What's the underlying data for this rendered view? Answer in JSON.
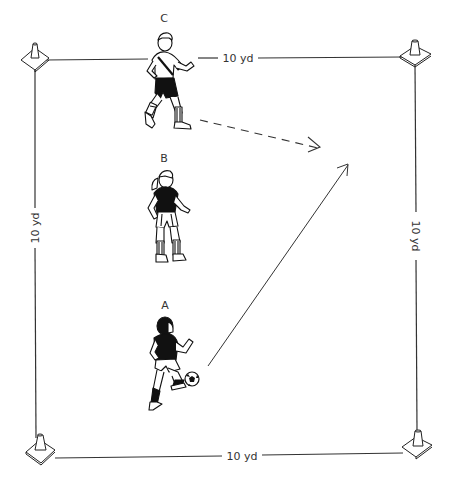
{
  "diagram": {
    "type": "soccer-drill",
    "field": {
      "shape": "square",
      "side_labels": {
        "top": "10 yd",
        "bottom": "10 yd",
        "left": "10 yd",
        "right": "10 yd"
      },
      "corners": [
        "cone",
        "cone",
        "cone",
        "cone"
      ]
    },
    "players": [
      {
        "label": "C",
        "role": "running player, top",
        "action": "runs forward (dashed path)"
      },
      {
        "label": "B",
        "role": "middle player",
        "action": "stands"
      },
      {
        "label": "A",
        "role": "player with ball, bottom",
        "action": "passes ball (solid arrow)"
      }
    ],
    "arrows": [
      {
        "style": "dashed",
        "from": "C",
        "meaning": "player run"
      },
      {
        "style": "solid",
        "from": "A",
        "meaning": "ball pass"
      }
    ],
    "colors": {
      "line": "#333333",
      "ink": "#111111",
      "background": "#ffffff"
    }
  }
}
